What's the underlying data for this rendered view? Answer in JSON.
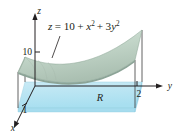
{
  "figure": {
    "background_color": "#ffffff",
    "surface_color": "#b9cec2",
    "surface_color_light": "#d8e4dc",
    "base_color": "#bfe6f2",
    "base_color_edge": "#9fd8ec",
    "line_color": "#231f20"
  },
  "equation": {
    "lhs": "z",
    "equals": "=",
    "constant": "10",
    "plus_1": "+",
    "term_x_base": "x",
    "term_x_exp": "2",
    "plus_2": "+",
    "term_y_coef": "3",
    "term_y_base": "y",
    "term_y_exp": "2",
    "full_text": "z = 10 + x² + 3y²"
  },
  "axes": {
    "z": {
      "label": "z",
      "ticks": [
        {
          "value": "10"
        }
      ]
    },
    "y": {
      "label": "y",
      "ticks": [
        {
          "value": "2"
        }
      ]
    },
    "x": {
      "label": "x",
      "ticks": [
        {
          "value": "1"
        }
      ]
    }
  },
  "region": {
    "label": "R"
  }
}
